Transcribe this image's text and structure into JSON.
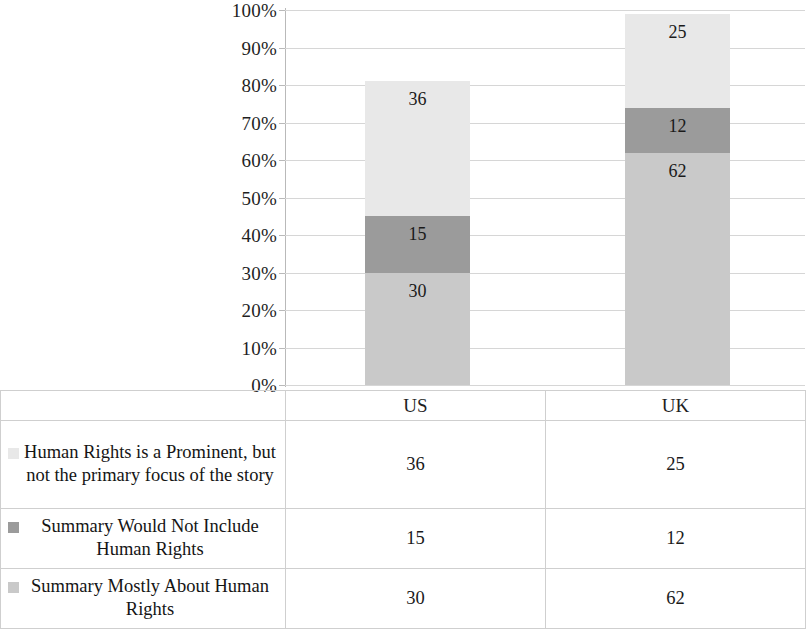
{
  "chart_data": {
    "type": "bar",
    "subtype": "stacked-100-percent",
    "title": "",
    "xlabel": "",
    "ylabel": "",
    "grid": true,
    "legend_position": "bottom-table",
    "categories": [
      "US",
      "UK"
    ],
    "y_ticks": [
      "0%",
      "10%",
      "20%",
      "30%",
      "40%",
      "50%",
      "60%",
      "70%",
      "80%",
      "90%",
      "100%"
    ],
    "ylim": [
      0,
      100
    ],
    "series": [
      {
        "name": "Human Rights is a Prominent, but not the primary focus of the story",
        "values": [
          36,
          25
        ],
        "color": "#e8e8e8",
        "stack_order": 3
      },
      {
        "name": "Summary Would Not Include Human Rights",
        "values": [
          15,
          12
        ],
        "color": "#9b9b9b",
        "stack_order": 2
      },
      {
        "name": "Summary Mostly About Human Rights",
        "values": [
          30,
          62
        ],
        "color": "#c9c9c9",
        "stack_order": 1
      }
    ]
  },
  "axis": {
    "ticks": [
      {
        "label": "100%",
        "value": 100
      },
      {
        "label": "90%",
        "value": 90
      },
      {
        "label": "80%",
        "value": 80
      },
      {
        "label": "70%",
        "value": 70
      },
      {
        "label": "60%",
        "value": 60
      },
      {
        "label": "50%",
        "value": 50
      },
      {
        "label": "40%",
        "value": 40
      },
      {
        "label": "30%",
        "value": 30
      },
      {
        "label": "20%",
        "value": 20
      },
      {
        "label": "10%",
        "value": 10
      },
      {
        "label": "0%",
        "value": 0
      }
    ]
  },
  "bars": {
    "us": {
      "category": "US",
      "segments": [
        {
          "label": "36",
          "value": 36,
          "color": "#e8e8e8"
        },
        {
          "label": "15",
          "value": 15,
          "color": "#9b9b9b"
        },
        {
          "label": "30",
          "value": 30,
          "color": "#c9c9c9"
        }
      ]
    },
    "uk": {
      "category": "UK",
      "segments": [
        {
          "label": "25",
          "value": 25,
          "color": "#e8e8e8"
        },
        {
          "label": "12",
          "value": 12,
          "color": "#9b9b9b"
        },
        {
          "label": "62",
          "value": 62,
          "color": "#c9c9c9"
        }
      ]
    }
  },
  "table": {
    "column_headers": [
      "",
      "US",
      "UK"
    ],
    "rows": [
      {
        "swatch_color": "#e8e8e8",
        "label": "Human Rights is a Prominent, but not the primary focus of the story",
        "us": "36",
        "uk": "25"
      },
      {
        "swatch_color": "#9b9b9b",
        "label": "Summary Would Not Include Human Rights",
        "us": "15",
        "uk": "12"
      },
      {
        "swatch_color": "#c9c9c9",
        "label": "Summary Mostly About Human Rights",
        "us": "30",
        "uk": "62"
      }
    ]
  }
}
